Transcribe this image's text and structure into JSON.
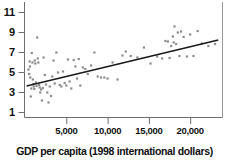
{
  "chart_data": {
    "type": "scatter",
    "title": "",
    "subtitle": "",
    "xlabel": "GDP per capita (1998 international dollars)",
    "ylabel": "",
    "xlim": [
      0,
      24000
    ],
    "ylim": [
      0.6,
      11.8
    ],
    "grid": false,
    "legend": null,
    "xticks": [
      5000,
      10000,
      15000,
      20000
    ],
    "xtick_labels": [
      "5,000",
      "10,000",
      "15,000",
      "20,000"
    ],
    "yticks": [
      1,
      3,
      5,
      7,
      9,
      11
    ],
    "ytick_labels": [
      "1",
      "3",
      "5",
      "7",
      "9",
      "11"
    ],
    "marker": {
      "shape": "square",
      "color": "#8c8c8c",
      "size": 2.2
    },
    "points": [
      {
        "x": 420,
        "y": 5.25
      },
      {
        "x": 500,
        "y": 4.8
      },
      {
        "x": 560,
        "y": 6.05
      },
      {
        "x": 600,
        "y": 5.55
      },
      {
        "x": 640,
        "y": 4.45
      },
      {
        "x": 700,
        "y": 2.55
      },
      {
        "x": 760,
        "y": 3.35
      },
      {
        "x": 820,
        "y": 6.9
      },
      {
        "x": 900,
        "y": 5.95
      },
      {
        "x": 950,
        "y": 4.25
      },
      {
        "x": 1000,
        "y": 3.8
      },
      {
        "x": 1060,
        "y": 3.55
      },
      {
        "x": 1120,
        "y": 3.3
      },
      {
        "x": 1180,
        "y": 6.15
      },
      {
        "x": 1250,
        "y": 5.85
      },
      {
        "x": 1320,
        "y": 3.95
      },
      {
        "x": 1400,
        "y": 3.6
      },
      {
        "x": 1480,
        "y": 8.45
      },
      {
        "x": 1550,
        "y": 6.35
      },
      {
        "x": 1620,
        "y": 5.95
      },
      {
        "x": 1700,
        "y": 3.7
      },
      {
        "x": 1780,
        "y": 3.45
      },
      {
        "x": 1850,
        "y": 2.95
      },
      {
        "x": 1950,
        "y": 3.25
      },
      {
        "x": 2050,
        "y": 2.15
      },
      {
        "x": 2150,
        "y": 3.4
      },
      {
        "x": 2250,
        "y": 6.45
      },
      {
        "x": 2400,
        "y": 4.7
      },
      {
        "x": 2550,
        "y": 3.75
      },
      {
        "x": 2700,
        "y": 2.95
      },
      {
        "x": 2850,
        "y": 1.95
      },
      {
        "x": 3000,
        "y": 3.55
      },
      {
        "x": 3150,
        "y": 2.6
      },
      {
        "x": 3300,
        "y": 4.55
      },
      {
        "x": 3450,
        "y": 6.15
      },
      {
        "x": 3600,
        "y": 3.85
      },
      {
        "x": 3800,
        "y": 6.95
      },
      {
        "x": 4000,
        "y": 4.95
      },
      {
        "x": 4200,
        "y": 3.7
      },
      {
        "x": 4400,
        "y": 3.55
      },
      {
        "x": 4600,
        "y": 5.05
      },
      {
        "x": 4800,
        "y": 3.9
      },
      {
        "x": 5000,
        "y": 3.65
      },
      {
        "x": 5200,
        "y": 6.25
      },
      {
        "x": 5400,
        "y": 4.05
      },
      {
        "x": 5600,
        "y": 3.35
      },
      {
        "x": 5900,
        "y": 6.2
      },
      {
        "x": 6100,
        "y": 5.55
      },
      {
        "x": 6300,
        "y": 4.35
      },
      {
        "x": 6500,
        "y": 6.3
      },
      {
        "x": 6700,
        "y": 3.65
      },
      {
        "x": 7000,
        "y": 5.45
      },
      {
        "x": 7300,
        "y": 5.3
      },
      {
        "x": 7600,
        "y": 4.8
      },
      {
        "x": 8000,
        "y": 5.65
      },
      {
        "x": 8400,
        "y": 6.95
      },
      {
        "x": 8800,
        "y": 4.55
      },
      {
        "x": 9200,
        "y": 4.45
      },
      {
        "x": 9600,
        "y": 4.45
      },
      {
        "x": 10000,
        "y": 4.35
      },
      {
        "x": 10600,
        "y": 5.95
      },
      {
        "x": 11200,
        "y": 4.25
      },
      {
        "x": 11800,
        "y": 6.65
      },
      {
        "x": 12200,
        "y": 7.05
      },
      {
        "x": 12800,
        "y": 6.6
      },
      {
        "x": 13600,
        "y": 6.45
      },
      {
        "x": 14400,
        "y": 7.45
      },
      {
        "x": 15200,
        "y": 5.85
      },
      {
        "x": 16000,
        "y": 6.55
      },
      {
        "x": 16600,
        "y": 6.35
      },
      {
        "x": 17000,
        "y": 8.1
      },
      {
        "x": 17300,
        "y": 8.05
      },
      {
        "x": 17500,
        "y": 6.4
      },
      {
        "x": 17700,
        "y": 7.6
      },
      {
        "x": 17900,
        "y": 8.55
      },
      {
        "x": 18000,
        "y": 7.95
      },
      {
        "x": 18100,
        "y": 9.55
      },
      {
        "x": 18300,
        "y": 7.8
      },
      {
        "x": 18500,
        "y": 8.95
      },
      {
        "x": 18700,
        "y": 6.6
      },
      {
        "x": 18900,
        "y": 9.05
      },
      {
        "x": 19200,
        "y": 8.5
      },
      {
        "x": 19600,
        "y": 6.55
      },
      {
        "x": 20000,
        "y": 8.75
      },
      {
        "x": 20400,
        "y": 6.6
      },
      {
        "x": 20900,
        "y": 9.1
      },
      {
        "x": 21400,
        "y": 7.85
      },
      {
        "x": 22200,
        "y": 7.6
      },
      {
        "x": 23000,
        "y": 7.8
      }
    ],
    "trendline": {
      "type": "linear",
      "color": "#1a1a1a",
      "x_start": 200,
      "y_start": 3.6,
      "x_end": 23400,
      "y_end": 8.2
    },
    "axes_style": {
      "axis_color": "#6e6e6e",
      "left_spine": true,
      "bottom_spine": true,
      "right_spine": true,
      "top_spine": false
    }
  }
}
